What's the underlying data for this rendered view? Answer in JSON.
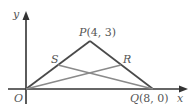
{
  "diagram": {
    "title": "",
    "axes": {
      "x_label": "x",
      "y_label": "y",
      "origin_label": "O"
    },
    "points": {
      "O": {
        "label": "O",
        "coords": [
          0,
          0
        ]
      },
      "P": {
        "label": "P",
        "coords_text": "(4, 3)",
        "coords": [
          4,
          3
        ]
      },
      "Q": {
        "label": "Q",
        "coords_text": "(8, 0)",
        "coords": [
          8,
          0
        ]
      },
      "S": {
        "label": "S"
      },
      "R": {
        "label": "R"
      }
    },
    "segments": [
      "OP",
      "PQ",
      "OQ",
      "SQ",
      "OR"
    ],
    "colors": {
      "axis": "#333333",
      "triangle": "#4a4a4a",
      "medians": "#8a8a8a",
      "text": "#555555"
    }
  }
}
